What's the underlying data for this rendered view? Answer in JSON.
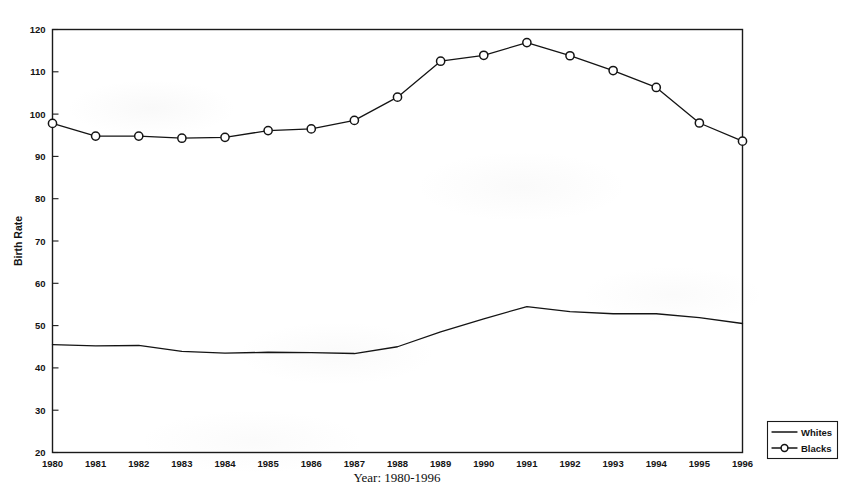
{
  "chart_data": {
    "type": "line",
    "title": "",
    "xlabel": "Year: 1980-1996",
    "ylabel": "Birth Rate",
    "categories": [
      1980,
      1981,
      1982,
      1983,
      1984,
      1985,
      1986,
      1987,
      1988,
      1989,
      1990,
      1991,
      1992,
      1993,
      1994,
      1995,
      1996
    ],
    "xtick_labels": [
      "1980",
      "1981",
      "1982",
      "1983",
      "1984",
      "1985",
      "1986",
      "1987",
      "1988",
      "1989",
      "1990",
      "1991",
      "1992",
      "1993",
      "1994",
      "1995",
      "1996"
    ],
    "ytick_labels": [
      "20",
      "30",
      "40",
      "50",
      "60",
      "70",
      "80",
      "90",
      "100",
      "110",
      "120"
    ],
    "ytick_values": [
      20,
      30,
      40,
      50,
      60,
      70,
      80,
      90,
      100,
      110,
      120
    ],
    "ylim": [
      20,
      120
    ],
    "xlim": [
      1980,
      1996
    ],
    "grid": false,
    "legend_position": "right-bottom-outside",
    "series": [
      {
        "name": "Whites",
        "marker": "none",
        "color": "#141414",
        "values": [
          45.5,
          45.2,
          45.3,
          43.9,
          43.5,
          43.7,
          43.6,
          43.4,
          45.0,
          48.5,
          51.6,
          54.5,
          53.3,
          52.8,
          52.8,
          51.9,
          50.5
        ]
      },
      {
        "name": "Blacks",
        "marker": "open-circle",
        "color": "#141414",
        "values": [
          97.8,
          94.8,
          94.8,
          94.3,
          94.5,
          96.1,
          96.5,
          98.5,
          104.0,
          112.5,
          113.9,
          116.9,
          113.8,
          110.3,
          106.3,
          97.9,
          93.6
        ]
      }
    ]
  },
  "legend": {
    "items": [
      {
        "label": "Whites",
        "marker": "line"
      },
      {
        "label": "Blacks",
        "marker": "line-circle"
      }
    ]
  },
  "axes": {
    "x_title": "Year: 1980-1996",
    "y_title": "Birth Rate"
  }
}
